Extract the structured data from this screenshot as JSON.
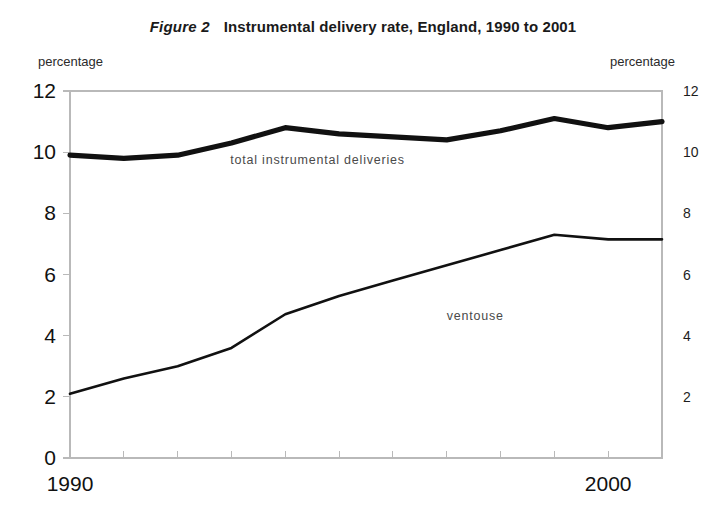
{
  "figure": {
    "number": "Figure 2",
    "title": "Instrumental delivery rate, England, 1990 to 2001",
    "left_axis_caption": "percentage",
    "right_axis_caption": "percentage"
  },
  "chart_data": {
    "type": "line",
    "title": "Instrumental delivery rate, England, 1990 to 2001",
    "subtitle": "Figure 2",
    "xlabel": "",
    "ylabel": "percentage",
    "y2label": "percentage",
    "x": [
      1990,
      1991,
      1992,
      1993,
      1994,
      1995,
      1996,
      1997,
      1998,
      1999,
      2000,
      2001
    ],
    "xlim": [
      1990,
      2001
    ],
    "ylim": [
      0,
      12
    ],
    "y2lim": [
      0,
      12
    ],
    "yticks": [
      0,
      2,
      4,
      6,
      8,
      10,
      12
    ],
    "y2ticks": [
      2,
      4,
      6,
      8,
      10,
      12
    ],
    "xticks": [
      1990,
      1991,
      1992,
      1993,
      1994,
      1995,
      1996,
      1997,
      1998,
      1999,
      2000,
      2001
    ],
    "xtick_labels": [
      "1990",
      "",
      "",
      "",
      "",
      "",
      "",
      "",
      "",
      "",
      "2000",
      ""
    ],
    "grid": false,
    "legend_position": "inline-annotations",
    "series": [
      {
        "name": "total instrumental deliveries",
        "values": [
          9.9,
          9.8,
          9.9,
          10.3,
          10.8,
          10.6,
          10.5,
          10.4,
          10.7,
          11.1,
          10.8,
          11.0
        ],
        "line_width": "thick",
        "label_x": 1994.6,
        "label_y": 9.6
      },
      {
        "name": "ventouse",
        "values": [
          2.1,
          2.6,
          3.0,
          3.6,
          4.7,
          5.3,
          5.8,
          6.3,
          6.8,
          7.3,
          7.15,
          7.15
        ],
        "line_width": "thin",
        "label_x": 1997.0,
        "label_y": 4.5
      }
    ]
  },
  "colors": {
    "line": "#111111",
    "frame": "#b9b9b9",
    "background": "#ffffff",
    "annotation_text": "#4a4a4a"
  }
}
